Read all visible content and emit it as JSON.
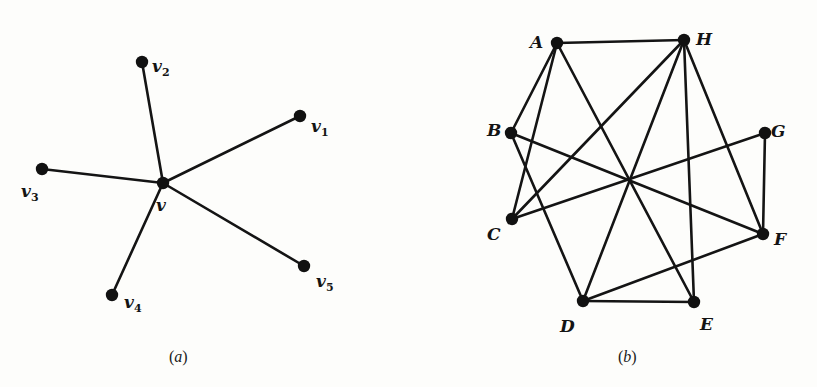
{
  "figure": {
    "width": 817,
    "height": 387,
    "background": "#fdfdfb",
    "ink_color": "#141414"
  },
  "graph_a": {
    "caption_open": "(",
    "caption_letter": "a",
    "caption_close": ")",
    "caption_pos": [
      169,
      362
    ],
    "vertices": [
      {
        "id": "v",
        "name": "v",
        "sub": "",
        "x": 163,
        "y": 183,
        "label_x": 156,
        "label_y": 206
      },
      {
        "id": "v1",
        "name": "v",
        "sub": "1",
        "x": 300,
        "y": 116,
        "label_x": 311,
        "label_y": 127
      },
      {
        "id": "v2",
        "name": "v",
        "sub": "2",
        "x": 142,
        "y": 62,
        "label_x": 152,
        "label_y": 67
      },
      {
        "id": "v3",
        "name": "v",
        "sub": "3",
        "x": 42,
        "y": 169,
        "label_x": 21,
        "label_y": 192
      },
      {
        "id": "v4",
        "name": "v",
        "sub": "4",
        "x": 112,
        "y": 295,
        "label_x": 124,
        "label_y": 303
      },
      {
        "id": "v5",
        "name": "v",
        "sub": "5",
        "x": 304,
        "y": 266,
        "label_x": 316,
        "label_y": 282
      }
    ],
    "edges": [
      [
        "v",
        "v1"
      ],
      [
        "v",
        "v2"
      ],
      [
        "v",
        "v3"
      ],
      [
        "v",
        "v4"
      ],
      [
        "v",
        "v5"
      ]
    ]
  },
  "graph_b": {
    "caption_open": "(",
    "caption_letter": "b",
    "caption_close": ")",
    "caption_pos": [
      618,
      362
    ],
    "vertices": [
      {
        "id": "A",
        "name": "A",
        "sub": "",
        "x": 557,
        "y": 43,
        "label_x": 530,
        "label_y": 43
      },
      {
        "id": "H",
        "name": "H",
        "sub": "",
        "x": 684,
        "y": 40,
        "label_x": 696,
        "label_y": 40
      },
      {
        "id": "B",
        "name": "B",
        "sub": "",
        "x": 511,
        "y": 133,
        "label_x": 487,
        "label_y": 131
      },
      {
        "id": "G",
        "name": "G",
        "sub": "",
        "x": 765,
        "y": 133,
        "label_x": 771,
        "label_y": 132
      },
      {
        "id": "C",
        "name": "C",
        "sub": "",
        "x": 512,
        "y": 219,
        "label_x": 487,
        "label_y": 235
      },
      {
        "id": "F",
        "name": "F",
        "sub": "",
        "x": 763,
        "y": 234,
        "label_x": 774,
        "label_y": 240
      },
      {
        "id": "D",
        "name": "D",
        "sub": "",
        "x": 583,
        "y": 301,
        "label_x": 560,
        "label_y": 327
      },
      {
        "id": "E",
        "name": "E",
        "sub": "",
        "x": 694,
        "y": 302,
        "label_x": 700,
        "label_y": 325
      }
    ],
    "edges": [
      [
        "A",
        "H"
      ],
      [
        "A",
        "B"
      ],
      [
        "A",
        "C"
      ],
      [
        "A",
        "E"
      ],
      [
        "H",
        "C"
      ],
      [
        "H",
        "D"
      ],
      [
        "H",
        "E"
      ],
      [
        "H",
        "F"
      ],
      [
        "B",
        "F"
      ],
      [
        "B",
        "D"
      ],
      [
        "C",
        "G"
      ],
      [
        "G",
        "F"
      ],
      [
        "D",
        "E"
      ],
      [
        "D",
        "F"
      ]
    ]
  }
}
